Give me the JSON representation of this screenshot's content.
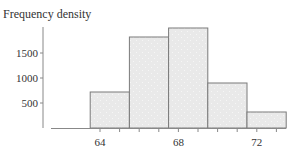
{
  "chart_data": {
    "type": "bar",
    "subtype": "histogram",
    "title": "Frequency density",
    "xlabel": "",
    "ylabel": "Frequency density",
    "bins": [
      {
        "start": 63.5,
        "end": 65.5,
        "value": 720
      },
      {
        "start": 65.5,
        "end": 67.5,
        "value": 1820
      },
      {
        "start": 67.5,
        "end": 69.5,
        "value": 2000
      },
      {
        "start": 69.5,
        "end": 71.5,
        "value": 900
      },
      {
        "start": 71.5,
        "end": 73.5,
        "value": 320
      }
    ],
    "categories": [
      "63.5-65.5",
      "65.5-67.5",
      "67.5-69.5",
      "69.5-71.5",
      "71.5-73.5"
    ],
    "values": [
      720,
      1820,
      2000,
      900,
      320
    ],
    "x_ticks": [
      64,
      68,
      72
    ],
    "x_minor_ticks": [
      64,
      65,
      66,
      67,
      68,
      69,
      70,
      71,
      72,
      73
    ],
    "y_ticks": [
      500,
      1000,
      1500
    ],
    "xlim": [
      61.5,
      73.5
    ],
    "ylim": [
      0,
      2000
    ],
    "grid": false,
    "legend": null,
    "colors": {
      "bar_fill": "#e9e9e9",
      "bar_stroke": "#7a7a7a",
      "axis": "#888888"
    }
  },
  "labels": {
    "title": "Frequency density",
    "y_ticks": [
      "500",
      "1000",
      "1500"
    ],
    "x_ticks": [
      "64",
      "68",
      "72"
    ]
  }
}
